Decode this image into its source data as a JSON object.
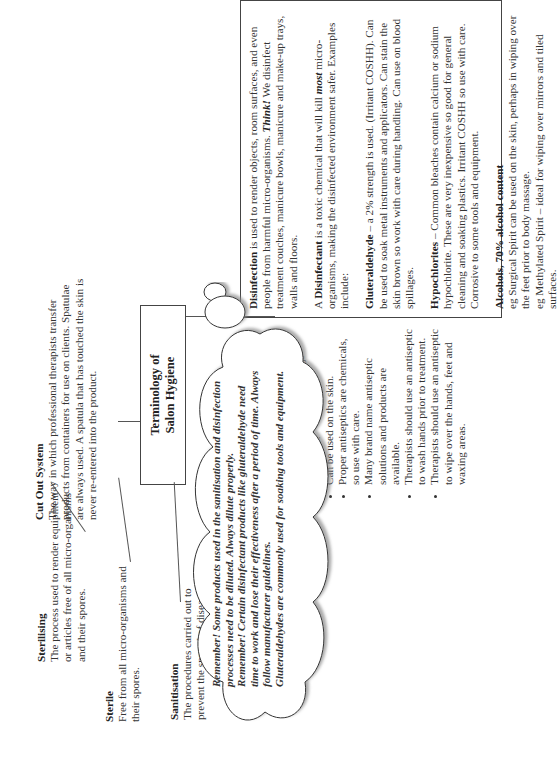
{
  "title": "Terminology of Salon Hygiene",
  "disinfection_box": {
    "disinfection": {
      "term": "Disinfection",
      "text": " is used to render objects, room surfaces, and even people from harmful micro-organisms. ",
      "think": "Think!",
      "text2": " We disinfect treatment couches, manicure bowls, manicure and make-up trays, walls and floors."
    },
    "disinfectant": {
      "pre": "A ",
      "term": "Disinfectant",
      "text": " is a toxic chemical that will kill ",
      "most": "most",
      "text2": " micro-organisms, making the disinfected environment safer. Examples include:"
    },
    "gluteraldehyde": {
      "term": "Gluteraldehyde",
      "text": " – a 2% strength is used. (Irritant COSHH). Can be used to soak metal instruments and applicators. Can stain the skin brown so work with care during handling. Can use on blood spillages."
    },
    "hypochlorites": {
      "term": "Hypochlorites",
      "text": " – Common bleaches contain calcium or sodium hypochlorite. These are very inexpensive so good for general cleaning and soaking plastics. Irritant COSHH so use with care. Corrosive to some tools and equipment."
    },
    "alcohols": {
      "term": "Alcohols, 70% alcohol content",
      "lines": [
        "eg Surgical Spirit can be used on the skin, perhaps in wiping over the feet prior to body massage.",
        "eg Methylated Spirit – ideal for wiping over mirrors and tiled surfaces."
      ]
    }
  },
  "cut_out_system": {
    "term": "Cut Out System",
    "text": "The way in which professional therapists transfer products from containers for use on clients. Spatulae are always used. A spatula that has touched the skin is never re-entered into the product."
  },
  "antiseptics": {
    "term": "Antiseptics",
    "items": [
      "Substances used to limit and prevent the growth of micro-organisms.",
      "Can be used on the skin.",
      "Proper antiseptics are chemicals, so use with care.",
      "Many brand name antiseptic solutions and products are available.",
      "Therapists should use an antiseptic to wash hands prior to treatment.",
      "Therapists should use an antiseptic to wipe over the hands, feet and waxing areas."
    ]
  },
  "sterilising": {
    "term": "Sterilising",
    "text": "The process used to render equipment or articles free of all micro-organisms and their spores."
  },
  "sterile": {
    "term": "Sterile",
    "text": "Free from all micro-organisms and their spores."
  },
  "sanitisation": {
    "term": "Sanitisation",
    "text": "The procedures carried out to prevent the spread of disease."
  },
  "cloud": {
    "lines": [
      "Remember! Some products used in the sanitisation and disinfection processes need to be diluted. Always dilute properly.",
      "Remember! Certain disinfectant products like gluteraldehyde need time to work and lose their effectiveness after a period of time. Always follow manufacturer guidelines.",
      "Gluteraldehydes are commonly used for soaking tools and equipment."
    ]
  }
}
